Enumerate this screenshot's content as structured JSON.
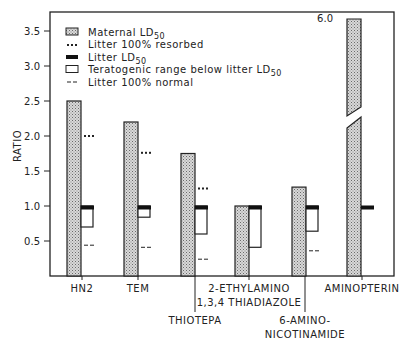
{
  "chart_data": {
    "type": "bar",
    "title": "",
    "xlabel": "",
    "ylabel": "RATIO",
    "ylim": [
      0,
      3.7
    ],
    "yticks": [
      0.5,
      1.0,
      1.5,
      2.0,
      2.5,
      3.0,
      3.5
    ],
    "ytick_labels": [
      "0.5",
      "1.0",
      "1.5",
      "2.0",
      "2.5",
      "3.0",
      "3.5"
    ],
    "grid": false,
    "legend_position": "upper-left-inside",
    "legend": [
      {
        "key": "maternal",
        "label": "Maternal LD",
        "sub": "50",
        "symbol": "stippled-box"
      },
      {
        "key": "resorbed",
        "label": "Litter 100% resorbed",
        "symbol": "dots"
      },
      {
        "key": "litter_ld50",
        "label": "Litter LD",
        "sub": "50",
        "symbol": "black-bar"
      },
      {
        "key": "teratogenic",
        "label": "Teratogenic range below litter LD",
        "sub": "50",
        "symbol": "open-box"
      },
      {
        "key": "normal",
        "label": "Litter 100% normal",
        "symbol": "dashes"
      }
    ],
    "categories": [
      "HN2",
      "TEM",
      "THIOTEPA",
      "2-ETHYLAMINO 1,3,4 THIADIAZOLE",
      "6-AMINO- NICOTINAMIDE",
      "AMINOPTERIN"
    ],
    "category_labels": [
      {
        "lines": [
          "HN2"
        ],
        "row": 0
      },
      {
        "lines": [
          "TEM"
        ],
        "row": 0
      },
      {
        "lines": [
          "THIOTEPA"
        ],
        "row": 2
      },
      {
        "lines": [
          "2-ETHYLAMINO",
          "1,3,4 THIADIAZOLE"
        ],
        "row": 0
      },
      {
        "lines": [
          "6-AMINO-",
          "NICOTINAMIDE"
        ],
        "row": 2
      },
      {
        "lines": [
          "AMINOPTERIN"
        ],
        "row": 0
      }
    ],
    "series": [
      {
        "name": "Maternal LD50",
        "values": [
          2.5,
          2.2,
          1.75,
          1.0,
          1.27,
          6.0
        ]
      },
      {
        "name": "Litter 100% resorbed",
        "values": [
          2.0,
          1.76,
          1.25,
          null,
          null,
          null
        ]
      },
      {
        "name": "Litter LD50",
        "values": [
          1.0,
          1.0,
          1.0,
          1.0,
          1.0,
          1.0
        ]
      },
      {
        "name": "Teratogenic range below litter LD50 (lower bound)",
        "values": [
          0.7,
          0.84,
          0.6,
          0.41,
          0.64,
          null
        ]
      },
      {
        "name": "Litter 100% normal",
        "values": [
          0.44,
          0.41,
          0.24,
          null,
          0.36,
          null
        ]
      }
    ],
    "annotations": [
      {
        "text": "6.0",
        "target": "AMINOPTERIN maternal LD50 (axis break)"
      }
    ]
  },
  "ui": {
    "ylabel": "RATIO",
    "break_label": "6.0",
    "legend_labels": [
      "Maternal LD",
      "Litter 100% resorbed",
      "Litter LD",
      "Teratogenic range below litter LD",
      "Litter 100% normal"
    ],
    "legend_sub": "50"
  }
}
